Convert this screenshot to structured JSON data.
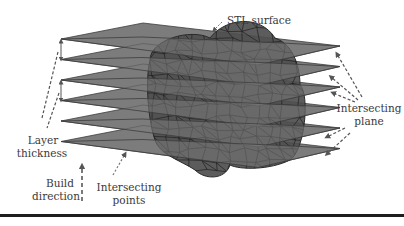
{
  "figure": {
    "labels": {
      "stl_surface": "STL surface",
      "layer_thickness_line1": "Layer",
      "layer_thickness_line2": "thickness",
      "intersecting_plane_line1": "Intersecting",
      "intersecting_plane_line2": "plane",
      "build_direction_line1": "Build",
      "build_direction_line2": "direction",
      "intersecting_points_line1": "Intersecting",
      "intersecting_points_line2": "points"
    },
    "plane_count": 6,
    "colors": {
      "plane_fill": "#7c7c7c",
      "plane_edge": "#3c3c3c",
      "mesh_fill": "#4e4e4e",
      "mesh_lines": "#1f1f1f",
      "label_text": "#3a3a3a",
      "arrow": "#555555",
      "rule": "#1e1e1e"
    }
  }
}
